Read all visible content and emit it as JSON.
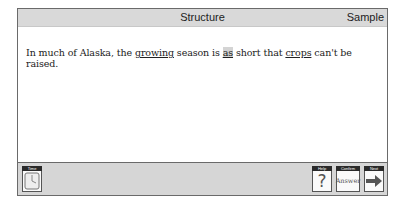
{
  "header": {
    "title": "Structure",
    "mode": "Sample"
  },
  "question": {
    "segments": [
      {
        "text": "In much of Alaska, the ",
        "style": "plain"
      },
      {
        "text": "growing",
        "style": "underline"
      },
      {
        "text": " season is ",
        "style": "plain"
      },
      {
        "text": "as",
        "style": "highlight"
      },
      {
        "text": " short that ",
        "style": "plain"
      },
      {
        "text": "crops",
        "style": "underline"
      },
      {
        "text": " can't be raised.",
        "style": "plain"
      }
    ]
  },
  "footer": {
    "time": {
      "label": "Time",
      "icon": "clock-icon"
    },
    "help": {
      "label": "Help",
      "icon": "question-mark-icon",
      "glyph": "?"
    },
    "confirm": {
      "label": "Confirm",
      "face": "Answer"
    },
    "next": {
      "label": "Next",
      "icon": "right-arrow-icon"
    }
  },
  "colors": {
    "bar_gray": "#d9d9d9",
    "border": "#6a6a6a",
    "highlight": "#d4d4d4"
  }
}
